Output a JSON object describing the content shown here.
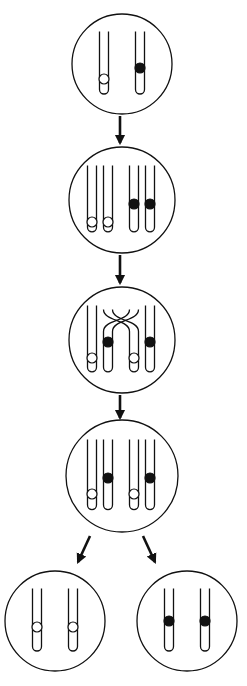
{
  "colors": {
    "stroke": "#111111",
    "background": "#ffffff",
    "allele_open": "#ffffff",
    "allele_filled": "#111111"
  },
  "stages": [
    {
      "id": "stage-1",
      "name": "homologous-chromosomes",
      "chromosomes": [
        {
          "group": "a",
          "allele": "open"
        },
        {
          "group": "b",
          "allele": "filled"
        }
      ]
    },
    {
      "id": "stage-2",
      "name": "replicated-chromatids",
      "chromosomes": [
        {
          "group": "a",
          "allele": "open"
        },
        {
          "group": "a",
          "allele": "open"
        },
        {
          "group": "b",
          "allele": "filled"
        },
        {
          "group": "b",
          "allele": "filled"
        }
      ]
    },
    {
      "id": "stage-3",
      "name": "crossing-over",
      "chromosomes": [
        {
          "group": "a",
          "allele": "open"
        },
        {
          "group": "a",
          "allele": "filled",
          "crossed": true
        },
        {
          "group": "b",
          "allele": "open",
          "crossed": true
        },
        {
          "group": "b",
          "allele": "filled"
        }
      ]
    },
    {
      "id": "stage-4",
      "name": "recombinant-chromatids",
      "chromosomes": [
        {
          "group": "a",
          "allele": "open"
        },
        {
          "group": "a",
          "allele": "filled"
        },
        {
          "group": "b",
          "allele": "open"
        },
        {
          "group": "b",
          "allele": "filled"
        }
      ]
    },
    {
      "id": "stage-5a",
      "name": "daughter-cell-open",
      "chromosomes": [
        {
          "group": "a",
          "allele": "open"
        },
        {
          "group": "b",
          "allele": "open"
        }
      ]
    },
    {
      "id": "stage-5b",
      "name": "daughter-cell-filled",
      "chromosomes": [
        {
          "group": "a",
          "allele": "filled"
        },
        {
          "group": "b",
          "allele": "filled"
        }
      ]
    }
  ],
  "arrows": [
    {
      "from": "stage-1",
      "to": "stage-2"
    },
    {
      "from": "stage-2",
      "to": "stage-3"
    },
    {
      "from": "stage-3",
      "to": "stage-4"
    },
    {
      "from": "stage-4",
      "to": "stage-5a"
    },
    {
      "from": "stage-4",
      "to": "stage-5b"
    }
  ]
}
